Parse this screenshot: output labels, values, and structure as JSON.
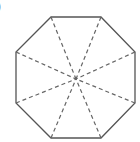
{
  "figure": {
    "label": ")",
    "shape": "regular octagon",
    "vertices": [
      [
        51,
        17
      ],
      [
        101,
        17
      ],
      [
        135,
        52
      ],
      [
        135,
        103
      ],
      [
        101,
        138
      ],
      [
        51,
        138
      ],
      [
        16,
        103
      ],
      [
        16,
        52
      ]
    ],
    "center": [
      76,
      79
    ],
    "outline_color": "#555555",
    "dash_color": "#666666",
    "diagonals": "dashed lines from each vertex to center (lines of symmetry)"
  }
}
